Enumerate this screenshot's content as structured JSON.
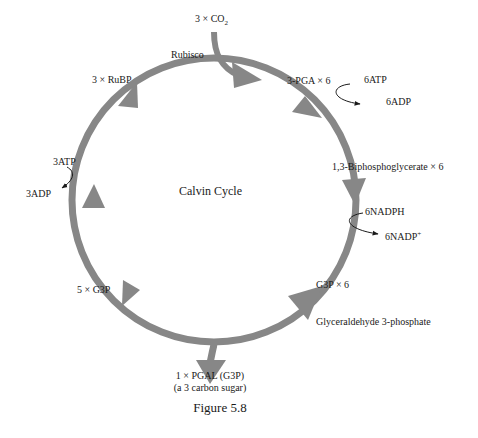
{
  "diagram": {
    "title": "Calvin Cycle",
    "caption": "Figure 5.8",
    "colors": {
      "cycle_arrow": "#878787",
      "text": "#1a1a1a",
      "thin_arrow": "#1a1a1a",
      "background": "#ffffff"
    },
    "inputs": {
      "co2": {
        "prefix": "3 × CO",
        "subscript": "2"
      },
      "enzyme": "Rubisco"
    },
    "nodes": {
      "pga": "3-PGA × 6",
      "bpg": "1,3-Biphosphoglycerate × 6",
      "g3p": "G3P × 6",
      "g3p_full_name": "Glyceraldehyde 3-phosphate",
      "g3p_recycled": "5 × G3P",
      "rubp": "3 × RuBP"
    },
    "cofactors": {
      "atp_in_right": "6ATP",
      "adp_out_right": "6ADP",
      "nadph_in": "6NADPH",
      "nadp_out": {
        "text": "6NADP",
        "superscript": "+"
      },
      "atp_in_left": "3ATP",
      "adp_out_left": "3ADP"
    },
    "output": {
      "line1": "1 × PGAL (G3P)",
      "line2": "(a 3 carbon sugar)"
    }
  }
}
